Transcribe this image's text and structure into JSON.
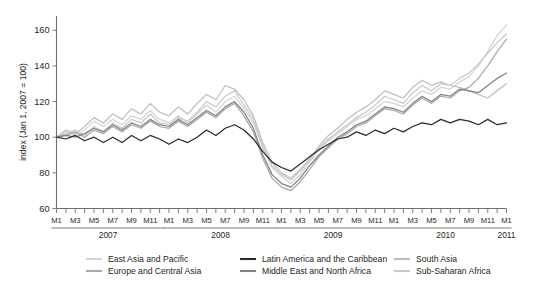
{
  "figure": {
    "background": "#ffffff",
    "axis_color": "#6d6e71",
    "text_color": "#231f20"
  },
  "chart_data": {
    "type": "line",
    "title": "",
    "subtitle": "",
    "xlabel": "",
    "ylabel": "index (Jan 1, 2007 = 100)",
    "ylim": [
      60,
      168
    ],
    "yticks": [
      60,
      80,
      100,
      120,
      140,
      160
    ],
    "ytick_labels": [
      "60",
      "80",
      "100",
      "120",
      "140",
      "160"
    ],
    "grid": false,
    "legend_position": "bottom",
    "x": [
      "2007-M1",
      "2007-M2",
      "2007-M3",
      "2007-M4",
      "2007-M5",
      "2007-M6",
      "2007-M7",
      "2007-M8",
      "2007-M9",
      "2007-M10",
      "2007-M11",
      "2007-M12",
      "2008-M1",
      "2008-M2",
      "2008-M3",
      "2008-M4",
      "2008-M5",
      "2008-M6",
      "2008-M7",
      "2008-M8",
      "2008-M9",
      "2008-M10",
      "2008-M11",
      "2008-M12",
      "2009-M1",
      "2009-M2",
      "2009-M3",
      "2009-M4",
      "2009-M5",
      "2009-M6",
      "2009-M7",
      "2009-M8",
      "2009-M9",
      "2009-M10",
      "2009-M11",
      "2009-M12",
      "2010-M1",
      "2010-M2",
      "2010-M3",
      "2010-M4",
      "2010-M5",
      "2010-M6",
      "2010-M7",
      "2010-M8",
      "2010-M9",
      "2010-M10",
      "2010-M11",
      "2010-M12",
      "2011-M1"
    ],
    "xtick_labels": [
      "M1",
      "",
      "M3",
      "",
      "M5",
      "",
      "M7",
      "",
      "M9",
      "",
      "M11",
      "",
      "M1",
      "",
      "M3",
      "",
      "M5",
      "",
      "M7",
      "",
      "M9",
      "",
      "M11",
      "",
      "M1",
      "",
      "M3",
      "",
      "M5",
      "",
      "M7",
      "",
      "M9",
      "",
      "M11",
      "",
      "M1",
      "",
      "M3",
      "",
      "M5",
      "",
      "M7",
      "",
      "M9",
      "",
      "M11",
      "",
      "M1"
    ],
    "year_groups": [
      {
        "label": "2007",
        "start_index": 0,
        "end_index": 11
      },
      {
        "label": "2008",
        "start_index": 12,
        "end_index": 23
      },
      {
        "label": "2009",
        "start_index": 24,
        "end_index": 35
      },
      {
        "label": "2010",
        "start_index": 36,
        "end_index": 47
      },
      {
        "label": "2011",
        "start_index": 48,
        "end_index": 48
      }
    ],
    "series": [
      {
        "name": "East Asia and Pacific",
        "color": "#d3d3d3",
        "values": [
          100,
          103,
          101,
          104,
          109,
          106,
          110,
          107,
          112,
          110,
          115,
          110,
          108,
          112,
          108,
          113,
          118,
          114,
          120,
          123,
          116,
          108,
          94,
          83,
          78,
          74,
          79,
          86,
          93,
          98,
          102,
          106,
          110,
          112,
          116,
          120,
          119,
          117,
          122,
          126,
          124,
          128,
          127,
          131,
          134,
          140,
          148,
          157,
          163
        ]
      },
      {
        "name": "Europe and Central Asia",
        "color": "#a7a9ac",
        "values": [
          100,
          101,
          103,
          100,
          104,
          102,
          106,
          103,
          107,
          105,
          109,
          106,
          105,
          109,
          106,
          110,
          114,
          111,
          116,
          119,
          112,
          103,
          88,
          77,
          72,
          70,
          75,
          82,
          89,
          94,
          99,
          102,
          106,
          108,
          112,
          116,
          115,
          113,
          118,
          122,
          119,
          123,
          122,
          126,
          128,
          133,
          140,
          148,
          155
        ]
      },
      {
        "name": "Latin America and the Caribbean",
        "color": "#2b2b2b",
        "values": [
          100,
          99,
          101,
          98,
          100,
          97,
          100,
          97,
          101,
          98,
          101,
          99,
          96,
          99,
          97,
          100,
          104,
          101,
          105,
          107,
          104,
          99,
          92,
          86,
          83,
          81,
          85,
          89,
          93,
          96,
          99,
          100,
          103,
          101,
          104,
          102,
          105,
          103,
          106,
          108,
          107,
          110,
          108,
          110,
          109,
          107,
          110,
          107,
          108
        ]
      },
      {
        "name": "Middle East and North Africa",
        "color": "#808285",
        "values": [
          100,
          101,
          100,
          102,
          105,
          103,
          107,
          104,
          108,
          106,
          110,
          107,
          106,
          110,
          107,
          111,
          115,
          112,
          117,
          120,
          114,
          105,
          90,
          79,
          74,
          72,
          77,
          84,
          90,
          95,
          100,
          103,
          107,
          109,
          113,
          117,
          116,
          114,
          119,
          123,
          120,
          124,
          123,
          127,
          126,
          125,
          129,
          133,
          136
        ]
      },
      {
        "name": "South Asia",
        "color": "#bcbec0",
        "values": [
          100,
          104,
          102,
          106,
          111,
          108,
          113,
          110,
          116,
          113,
          119,
          114,
          112,
          117,
          113,
          119,
          124,
          121,
          129,
          127,
          121,
          112,
          97,
          86,
          80,
          77,
          82,
          88,
          95,
          101,
          105,
          110,
          114,
          117,
          121,
          126,
          124,
          122,
          128,
          132,
          129,
          131,
          129,
          128,
          126,
          124,
          122,
          126,
          130
        ]
      },
      {
        "name": "Sub-Saharan Africa",
        "color": "#c8c9cb",
        "values": [
          100,
          102,
          104,
          101,
          106,
          103,
          108,
          105,
          110,
          108,
          113,
          108,
          107,
          111,
          109,
          114,
          120,
          117,
          123,
          126,
          118,
          110,
          95,
          84,
          79,
          76,
          81,
          87,
          94,
          99,
          103,
          107,
          111,
          114,
          118,
          123,
          121,
          119,
          125,
          129,
          126,
          130,
          129,
          133,
          136,
          141,
          147,
          153,
          158
        ]
      }
    ]
  },
  "legend": {
    "columns": [
      [
        {
          "label": "East Asia and Pacific",
          "color": "#d3d3d3"
        },
        {
          "label": "Europe and Central Asia",
          "color": "#a7a9ac"
        }
      ],
      [
        {
          "label": "Latin America and the Caribbean",
          "color": "#2b2b2b"
        },
        {
          "label": "Middle East and North Africa",
          "color": "#808285"
        }
      ],
      [
        {
          "label": "South Asia",
          "color": "#bcbec0"
        },
        {
          "label": "Sub-Saharan Africa",
          "color": "#c8c9cb"
        }
      ]
    ]
  }
}
